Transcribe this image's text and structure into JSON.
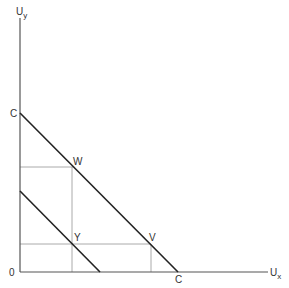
{
  "diagram": {
    "axes": {
      "y_label": "U",
      "y_sub": "y",
      "x_label": "U",
      "x_sub": "x",
      "origin_label": "0"
    },
    "points": {
      "c_top": "C",
      "c_bottom": "C",
      "w": "W",
      "y": "Y",
      "v": "V"
    },
    "colors": {
      "axis": "#555555",
      "line": "#222222",
      "guide": "#aaaaaa"
    }
  }
}
